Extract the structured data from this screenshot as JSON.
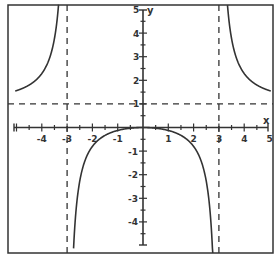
{
  "chart_data": {
    "type": "line",
    "title": "",
    "function": "y = x^2 / (x^2 - 9)",
    "xlabel": "x",
    "ylabel": "y",
    "xlim": [
      -5.4,
      5.1
    ],
    "ylim": [
      -5.3,
      5.2
    ],
    "grid": false,
    "legend": null,
    "x_ticks": [
      -4,
      -3,
      -2,
      -1,
      1,
      2,
      3,
      4,
      5
    ],
    "y_ticks": [
      5,
      4,
      3,
      2,
      1,
      -1,
      -2,
      -3,
      -4
    ],
    "x_tick_labels": [
      "-4",
      "-3",
      "-2",
      "-1",
      "1",
      "2",
      "3",
      "4",
      "5"
    ],
    "y_tick_labels": [
      "5",
      "4",
      "3",
      "2",
      "1",
      "-1",
      "-2",
      "-3",
      "-4"
    ],
    "minor_tick_step": 0.5,
    "asymptotes": [
      {
        "type": "vertical",
        "x": -3,
        "style": "dashed"
      },
      {
        "type": "vertical",
        "x": 3,
        "style": "dashed"
      },
      {
        "type": "horizontal",
        "y": 1,
        "style": "dashed"
      }
    ],
    "series": [
      {
        "name": "left branch",
        "domain": [
          -5.05,
          -3
        ],
        "points": [
          [
            -5,
            1.56
          ],
          [
            -4.5,
            1.8
          ],
          [
            -4,
            2.29
          ],
          [
            -3.5,
            3.77
          ],
          [
            -3.3,
            5.76
          ]
        ]
      },
      {
        "name": "middle branch",
        "domain": [
          -3,
          3
        ],
        "points": [
          [
            -2.85,
            -9.26
          ],
          [
            -2.7,
            -4.26
          ],
          [
            -2.5,
            -2.27
          ],
          [
            -2,
            -0.8
          ],
          [
            -1,
            -0.125
          ],
          [
            0,
            0
          ],
          [
            1,
            -0.125
          ],
          [
            2,
            -0.8
          ],
          [
            2.5,
            -2.27
          ],
          [
            2.7,
            -4.26
          ],
          [
            2.85,
            -9.26
          ]
        ]
      },
      {
        "name": "right branch",
        "domain": [
          3,
          5.05
        ],
        "points": [
          [
            3.3,
            5.76
          ],
          [
            3.5,
            3.77
          ],
          [
            4,
            2.29
          ],
          [
            4.5,
            1.8
          ],
          [
            5,
            1.56
          ]
        ]
      }
    ]
  },
  "labels": {
    "x_axis": "x",
    "y_axis": "y"
  },
  "colors": {
    "frame": "#333333",
    "curve": "#333333",
    "axis": "#333333",
    "dash": "#333333",
    "background": "#ffffff"
  }
}
